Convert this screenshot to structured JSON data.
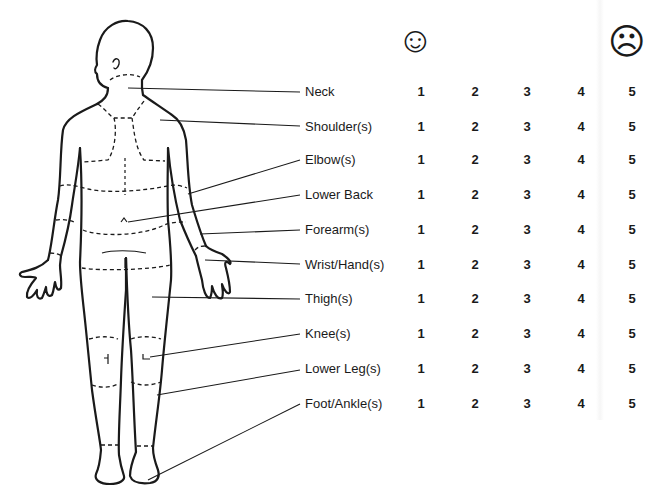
{
  "scale": {
    "best_icon": "smiley-face",
    "best_glyph": "☺",
    "worst_icon": "frowning-face",
    "worst_glyph": "☹",
    "values": [
      "1",
      "2",
      "3",
      "4",
      "5"
    ]
  },
  "body_regions": [
    {
      "label": "Neck"
    },
    {
      "label": "Shoulder(s)"
    },
    {
      "label": "Elbow(s)"
    },
    {
      "label": "Lower Back"
    },
    {
      "label": "Forearm(s)"
    },
    {
      "label": "Wrist/Hand(s)"
    },
    {
      "label": "Thigh(s)"
    },
    {
      "label": "Knee(s)"
    },
    {
      "label": "Lower Leg(s)"
    },
    {
      "label": "Foot/Ankle(s)"
    }
  ],
  "colors": {
    "ink": "#1a1a1a",
    "background": "#ffffff"
  }
}
